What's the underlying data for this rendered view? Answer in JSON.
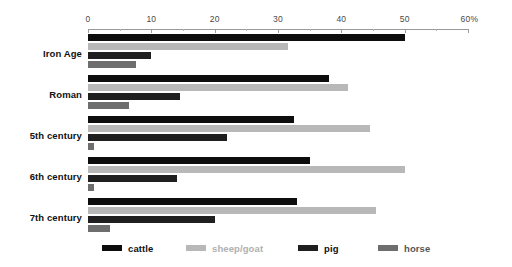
{
  "chart_data": {
    "type": "bar",
    "orientation": "horizontal",
    "title": "",
    "subtitle": "",
    "xlabel": "",
    "ylabel": "",
    "xlim": [
      0,
      60
    ],
    "xunit": "%",
    "grid": false,
    "legend_position": "bottom",
    "categories": [
      "Iron Age",
      "Roman",
      "5th century",
      "6th century",
      "7th century"
    ],
    "axis_ticks": [
      {
        "value": 0,
        "label": "0"
      },
      {
        "value": 10,
        "label": "10"
      },
      {
        "value": 20,
        "label": "20"
      },
      {
        "value": 30,
        "label": "30"
      },
      {
        "value": 40,
        "label": "40"
      },
      {
        "value": 50,
        "label": "50"
      },
      {
        "value": 60,
        "label": "60%"
      }
    ],
    "minor_ticks": [
      5,
      15,
      25,
      35,
      45,
      55
    ],
    "series": [
      {
        "name": "cattle",
        "color": "#0d0d0d",
        "values": [
          50.0,
          38.0,
          32.5,
          35.0,
          33.0
        ]
      },
      {
        "name": "sheep/goat",
        "color": "#b8b8b8",
        "values": [
          31.5,
          41.0,
          44.5,
          50.0,
          45.5
        ]
      },
      {
        "name": "pig",
        "color": "#1f1f1f",
        "values": [
          10.0,
          14.5,
          22.0,
          14.0,
          20.0
        ]
      },
      {
        "name": "horse",
        "color": "#6e6e6e",
        "values": [
          7.5,
          6.5,
          1.0,
          1.0,
          3.5
        ]
      }
    ]
  },
  "legend": {
    "items": [
      {
        "label": "cattle",
        "color": "#0d0d0d",
        "text_color": "#111111",
        "left": 102
      },
      {
        "label": "sheep/goat",
        "color": "#b8b8b8",
        "text_color": "#b0b0b0",
        "left": 186
      },
      {
        "label": "pig",
        "color": "#1f1f1f",
        "text_color": "#111111",
        "left": 298
      },
      {
        "label": "horse",
        "color": "#6e6e6e",
        "text_color": "#555555",
        "left": 378
      }
    ]
  }
}
